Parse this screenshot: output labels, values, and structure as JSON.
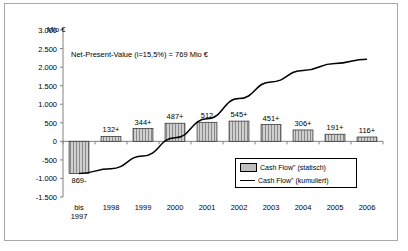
{
  "chart_data": {
    "type": "bar",
    "title": "Net-Present-Value (i=15,5%) = 769 Mio €",
    "ylabel": "Mio €",
    "xlabel": "",
    "ylim": [
      -1500,
      3000
    ],
    "ytick_step": 500,
    "grid": false,
    "legend_position": "inside-bottom-right",
    "categories": [
      "bis 1997",
      "1998",
      "1999",
      "2000",
      "2001",
      "2002",
      "2003",
      "2004",
      "2005",
      "2006"
    ],
    "category_lines": [
      [
        "bis",
        "1997"
      ],
      [
        "1998"
      ],
      [
        "1999"
      ],
      [
        "2000"
      ],
      [
        "2001"
      ],
      [
        "2002"
      ],
      [
        "2003"
      ],
      [
        "2004"
      ],
      [
        "2005"
      ],
      [
        "2006"
      ]
    ],
    "ytick_labels": [
      "3.000",
      "2.500",
      "2.000",
      "1.500",
      "1.000",
      "500",
      "0",
      "-500",
      "-1.000",
      "-1.500"
    ],
    "ytick_values": [
      3000,
      2500,
      2000,
      1500,
      1000,
      500,
      0,
      -500,
      -1000,
      -1500
    ],
    "series": [
      {
        "name": "Cash Flow\" (statisch)",
        "type": "bar",
        "values": [
          -869,
          132,
          344,
          487,
          512,
          545,
          451,
          306,
          191,
          116
        ],
        "data_labels": [
          "869-",
          "132+",
          "344+",
          "487+",
          "512",
          "545+",
          "451+",
          "306+",
          "191+",
          "116+"
        ]
      },
      {
        "name": "Cash Flow\" (kumuliert)",
        "type": "line",
        "values": [
          -869,
          -737,
          -393,
          94,
          606,
          1151,
          1602,
          1908,
          2099,
          2215
        ]
      }
    ],
    "legend": [
      {
        "label": "Cash Flow\" (statisch)",
        "marker": "bar-swatch"
      },
      {
        "label": "Cash Flow\" (kumuliert)",
        "marker": "line-swatch"
      }
    ]
  }
}
